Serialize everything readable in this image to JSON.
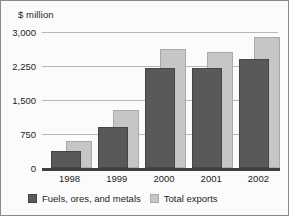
{
  "chart_data": {
    "type": "bar",
    "title": "",
    "ylabel": "$ million",
    "xlabel": "",
    "categories": [
      "1998",
      "1999",
      "2000",
      "2001",
      "2002"
    ],
    "series": [
      {
        "name": "Fuels, ores, and metals",
        "color": "#595959",
        "values": [
          375,
          900,
          2210,
          2200,
          2400
        ]
      },
      {
        "name": "Total exports",
        "color": "#c6c6c6",
        "values": [
          600,
          1280,
          2620,
          2570,
          2890
        ]
      }
    ],
    "ylim": [
      0,
      3000
    ],
    "yticks": [
      0,
      750,
      1500,
      2250,
      3000
    ],
    "ytick_labels": [
      "0",
      "750",
      "1,500",
      "2,250",
      "3,000"
    ],
    "grid": true,
    "legend_position": "bottom-left",
    "overlap_style": "offset-overlapping"
  },
  "legend": {
    "entries": [
      {
        "label": "Fuels, ores, and metals"
      },
      {
        "label": "Total exports"
      }
    ]
  }
}
